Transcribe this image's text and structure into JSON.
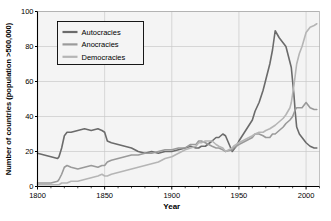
{
  "chart_data": {
    "type": "line",
    "title": "",
    "xlabel": "Year",
    "ylabel": "Number of countries (population >500,000)",
    "xlim": [
      1800,
      2010
    ],
    "ylim": [
      0,
      100
    ],
    "xticks": [
      1800,
      1850,
      1900,
      1950,
      2000
    ],
    "yticks": [
      0,
      20,
      40,
      60,
      80,
      100
    ],
    "grid": true,
    "legend_position": "top-left",
    "x": [
      1800,
      1805,
      1810,
      1815,
      1816,
      1818,
      1820,
      1822,
      1825,
      1830,
      1835,
      1840,
      1845,
      1848,
      1850,
      1852,
      1855,
      1860,
      1865,
      1870,
      1875,
      1880,
      1885,
      1890,
      1895,
      1900,
      1905,
      1910,
      1914,
      1918,
      1920,
      1922,
      1925,
      1930,
      1933,
      1935,
      1938,
      1940,
      1945,
      1946,
      1948,
      1950,
      1955,
      1960,
      1962,
      1965,
      1968,
      1970,
      1973,
      1975,
      1977,
      1980,
      1983,
      1985,
      1988,
      1989,
      1990,
      1991,
      1992,
      1993,
      1995,
      1997,
      2000,
      2003,
      2006,
      2008
    ],
    "series": [
      {
        "name": "Autocracies",
        "color": "#6b6b6b",
        "values": [
          19,
          18,
          17,
          16,
          17,
          22,
          29,
          31,
          31,
          32,
          33,
          32,
          33,
          32,
          31,
          26,
          25,
          24,
          23,
          22,
          20,
          19,
          20,
          19,
          20,
          20,
          21,
          22,
          23,
          22,
          22,
          23,
          23,
          26,
          28,
          28,
          30,
          29,
          20,
          21,
          23,
          26,
          32,
          38,
          43,
          48,
          55,
          61,
          70,
          78,
          89,
          85,
          82,
          80,
          71,
          68,
          60,
          52,
          42,
          34,
          30,
          28,
          25,
          23,
          22,
          22
        ]
      },
      {
        "name": "Anocracies",
        "color": "#9a9a9a",
        "values": [
          2,
          2,
          2,
          3,
          4,
          7,
          11,
          12,
          11,
          10,
          11,
          12,
          11,
          12,
          12,
          14,
          15,
          16,
          17,
          18,
          18,
          19,
          19,
          20,
          21,
          21,
          22,
          22,
          24,
          24,
          26,
          26,
          25,
          23,
          22,
          22,
          21,
          20,
          21,
          22,
          23,
          24,
          26,
          28,
          30,
          30,
          29,
          28,
          28,
          30,
          30,
          32,
          34,
          36,
          38,
          39,
          40,
          42,
          44,
          45,
          45,
          45,
          48,
          45,
          44,
          44
        ]
      },
      {
        "name": "Democracies",
        "color": "#b5b5b5",
        "values": [
          1,
          1,
          1,
          1,
          1,
          2,
          2,
          2,
          3,
          3,
          4,
          5,
          6,
          7,
          6,
          6,
          7,
          8,
          9,
          10,
          11,
          12,
          13,
          14,
          16,
          17,
          19,
          21,
          22,
          23,
          25,
          25,
          26,
          26,
          24,
          23,
          22,
          20,
          22,
          23,
          24,
          25,
          27,
          29,
          30,
          31,
          31,
          32,
          33,
          34,
          35,
          37,
          39,
          41,
          45,
          48,
          53,
          58,
          64,
          70,
          76,
          80,
          88,
          91,
          92,
          93
        ]
      }
    ]
  },
  "legend": {
    "items": [
      {
        "label": "Autocracies",
        "color": "#6b6b6b"
      },
      {
        "label": "Anocracies",
        "color": "#9a9a9a"
      },
      {
        "label": "Democracies",
        "color": "#b5b5b5"
      }
    ]
  },
  "axes": {
    "y_label": "Number of countries (population >500,000)",
    "x_label": "Year",
    "y_ticks": [
      "0",
      "20",
      "40",
      "60",
      "80",
      "100"
    ],
    "x_ticks": [
      "1800",
      "1850",
      "1900",
      "1950",
      "2000"
    ]
  },
  "colors": {
    "grid": "#c9c9c9",
    "axis": "#000000",
    "plot_bg": "#f4f4f4",
    "page_bg": "#ffffff"
  }
}
